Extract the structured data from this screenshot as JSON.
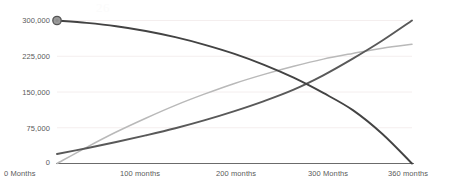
{
  "chart_data": {
    "type": "line",
    "title": "",
    "subtitle": "",
    "xlabel": "",
    "ylabel": "",
    "xlim": [
      0,
      360
    ],
    "ylim": [
      0,
      300000
    ],
    "grid": true,
    "legend": null,
    "x_tick_values": [
      0,
      100,
      200,
      300,
      360
    ],
    "x_tick_labels": [
      "0 Months",
      "100 months",
      "200 months",
      "300 Months",
      "360 months"
    ],
    "y_tick_values": [
      0,
      75000,
      150000,
      225000,
      300000
    ],
    "y_tick_labels": [
      "0",
      "75,000",
      "150,000",
      "225,000",
      "300,000"
    ],
    "series": [
      {
        "name": "declining-balance",
        "color": "#434343",
        "width": 1.9,
        "shape": "concave-decreasing",
        "marker": {
          "at_x": 0,
          "at_y": 300000,
          "fill": "#9a9a9a",
          "stroke": "#555555",
          "radius": 4.2
        },
        "x": [
          0,
          30,
          60,
          90,
          120,
          150,
          180,
          210,
          240,
          270,
          300,
          330,
          360
        ],
        "values": [
          300000,
          295000,
          288000,
          278000,
          265000,
          249000,
          230000,
          207000,
          180000,
          148000,
          112000,
          62000,
          0
        ]
      },
      {
        "name": "accelerating-growth",
        "color": "#595959",
        "width": 1.9,
        "shape": "convex-increasing",
        "marker": null,
        "x": [
          0,
          30,
          60,
          90,
          120,
          150,
          180,
          210,
          240,
          270,
          300,
          330,
          360
        ],
        "values": [
          20000,
          32000,
          45000,
          59000,
          74000,
          91000,
          110000,
          131000,
          155000,
          185000,
          220000,
          258000,
          300000
        ]
      },
      {
        "name": "plateauing-growth",
        "color": "#b9b9b9",
        "width": 1.5,
        "shape": "concave-increasing",
        "marker": null,
        "x": [
          0,
          30,
          60,
          90,
          120,
          150,
          180,
          210,
          240,
          270,
          300,
          330,
          360
        ],
        "values": [
          0,
          34000,
          66000,
          95000,
          122000,
          146000,
          168000,
          187000,
          204000,
          219000,
          231000,
          242000,
          250000
        ]
      }
    ],
    "axes": {
      "axis_color": "#6b6b6b",
      "gridline_color": "#f4eeee",
      "tick_label_color": "#5a5a5a"
    },
    "watermark_text": "26"
  }
}
